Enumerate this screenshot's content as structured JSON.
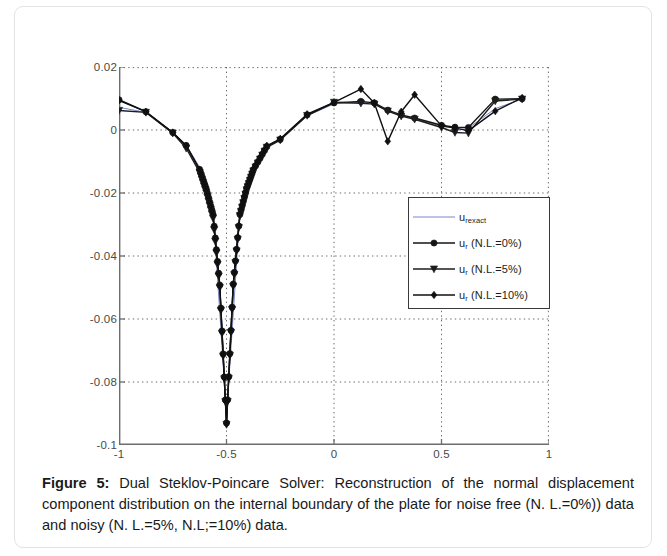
{
  "figure": {
    "caption_label": "Figure 5",
    "caption_separator": ":",
    "caption_text": " Dual Steklov-Poincare Solver: Reconstruction of the normal displacement component distribution on the internal boundary of the plate for noise free (N. L.=0%)) data and noisy (N. L.=5%, N.L;=10%) data."
  },
  "chart_data": {
    "type": "line",
    "title": "",
    "xlabel": "",
    "ylabel": "",
    "xlim": [
      -1,
      1
    ],
    "ylim": [
      -0.1,
      0.02
    ],
    "xticks": [
      "-1",
      "-0.5",
      "0",
      "0.5",
      "1"
    ],
    "xtick_values": [
      -1,
      -0.5,
      0,
      0.5,
      1
    ],
    "yticks": [
      "0.02",
      "0",
      "-0.02",
      "-0.04",
      "-0.06",
      "-0.08",
      "-0.1"
    ],
    "ytick_values": [
      0.02,
      0,
      -0.02,
      -0.04,
      -0.06,
      -0.08,
      -0.1
    ],
    "grid": true,
    "grid_style": "dotted",
    "legend_position": "center-right",
    "series": [
      {
        "name": "u_rexact",
        "label_main": "u",
        "label_sub": "rexact",
        "marker": "none",
        "color": "#7a86c8",
        "linewidth": 1.0,
        "x": [
          -1.0,
          -0.875,
          -0.75,
          -0.6875,
          -0.625,
          -0.5625,
          -0.5,
          -0.4375,
          -0.375,
          -0.3125,
          -0.25,
          -0.125,
          0.0,
          0.125,
          0.1875,
          0.25,
          0.3125,
          0.375,
          0.5,
          0.5625,
          0.625,
          0.75,
          0.875
        ],
        "y": [
          0.0072,
          0.0056,
          -0.0006,
          -0.0048,
          -0.0118,
          -0.0255,
          -0.0905,
          -0.0262,
          -0.0128,
          -0.0052,
          -0.0029,
          0.0045,
          0.0083,
          0.0088,
          0.0085,
          0.0062,
          0.0046,
          0.0036,
          0.0012,
          0.0007,
          0.0006,
          0.0068,
          0.0098
        ]
      },
      {
        "name": "u_r (N.L.=0%)",
        "label_main": "u",
        "label_sub": "r",
        "label_tail": " (N.L.=0%)",
        "marker": "circle",
        "color": "#151515",
        "linewidth": 1.4,
        "x": [
          -1.0,
          -0.875,
          -0.75,
          -0.6875,
          -0.625,
          -0.59375,
          -0.5625,
          -0.53125,
          -0.5,
          -0.46875,
          -0.4375,
          -0.40625,
          -0.375,
          -0.3125,
          -0.25,
          -0.125,
          0.0,
          0.125,
          0.1875,
          0.25,
          0.3125,
          0.375,
          0.5,
          0.5625,
          0.625,
          0.75,
          0.875
        ],
        "y": [
          0.0096,
          0.0058,
          -0.0008,
          -0.0049,
          -0.0125,
          -0.0188,
          -0.0268,
          -0.0492,
          -0.093,
          -0.0489,
          -0.0268,
          -0.0186,
          -0.0126,
          -0.0053,
          -0.003,
          0.0048,
          0.0086,
          0.0091,
          0.0086,
          0.0063,
          0.0048,
          0.0038,
          0.0015,
          0.0009,
          0.0008,
          0.0098,
          0.0099
        ]
      },
      {
        "name": "u_r (N.L.=5%)",
        "label_main": "u",
        "label_sub": "r",
        "label_tail": " (N.L.=5%)",
        "marker": "triangle-down",
        "color": "#1d1d1d",
        "linewidth": 1.4,
        "x": [
          -1.0,
          -0.875,
          -0.75,
          -0.6875,
          -0.625,
          -0.59375,
          -0.5625,
          -0.53125,
          -0.5,
          -0.46875,
          -0.4375,
          -0.40625,
          -0.375,
          -0.3125,
          -0.25,
          -0.125,
          0.0,
          0.125,
          0.1875,
          0.25,
          0.3125,
          0.375,
          0.5,
          0.5625,
          0.625,
          0.75,
          0.875
        ],
        "y": [
          0.0062,
          0.0056,
          -0.001,
          -0.0058,
          -0.0135,
          -0.02,
          -0.028,
          -0.05,
          -0.0935,
          -0.0496,
          -0.0272,
          -0.019,
          -0.013,
          -0.0055,
          -0.0032,
          0.0046,
          0.0088,
          0.0085,
          0.0082,
          0.006,
          0.0044,
          0.0034,
          0.0008,
          -0.0008,
          -0.001,
          0.0092,
          0.0098
        ]
      },
      {
        "name": "u_r (N.L.=10%)",
        "label_main": "u",
        "label_sub": "r",
        "label_tail": " (N.L.=10%)",
        "marker": "diamond",
        "color": "#101010",
        "linewidth": 1.4,
        "x": [
          -1.0,
          -0.875,
          -0.75,
          -0.6875,
          -0.625,
          -0.59375,
          -0.5625,
          -0.53125,
          -0.5,
          -0.46875,
          -0.4375,
          -0.40625,
          -0.375,
          -0.3125,
          -0.25,
          -0.125,
          0.0,
          0.125,
          0.1875,
          0.25,
          0.3125,
          0.375,
          0.5,
          0.5625,
          0.625,
          0.75,
          0.875
        ],
        "y": [
          0.0094,
          0.0058,
          -0.0008,
          -0.005,
          -0.0127,
          -0.019,
          -0.027,
          -0.0494,
          -0.0932,
          -0.0491,
          -0.0266,
          -0.0184,
          -0.0124,
          -0.005,
          -0.0028,
          0.005,
          0.0088,
          0.013,
          0.0086,
          -0.0036,
          0.0058,
          0.0112,
          0.0013,
          0.0006,
          -0.0002,
          0.006,
          0.0102
        ]
      }
    ]
  }
}
